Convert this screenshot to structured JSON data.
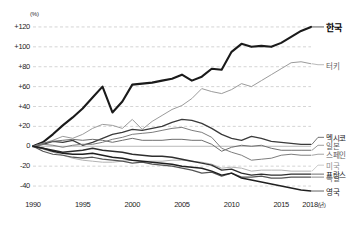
{
  "chart_data": {
    "type": "line",
    "title": "",
    "subtitle": "",
    "xlabel": "",
    "ylabel": "(%)",
    "unit_label": "(%)",
    "x_axis_suffix": "(년)",
    "xlim": [
      1990,
      2018
    ],
    "ylim": [
      -50,
      130
    ],
    "y_ticks": [
      "+120",
      "+100",
      "+80",
      "+60",
      "+40",
      "+20",
      "0",
      "-20",
      "-40"
    ],
    "y_tick_values": [
      120,
      100,
      80,
      60,
      40,
      20,
      0,
      -20,
      -40
    ],
    "x_ticks": [
      "1990",
      "1995",
      "2000",
      "2005",
      "2010",
      "2015",
      "2018"
    ],
    "x_tick_values": [
      1990,
      1995,
      2000,
      2005,
      2010,
      2015,
      2018
    ],
    "grid": true,
    "grid_style": "dashed-horizontal",
    "legend_position": "right-inline",
    "x": [
      1990,
      1991,
      1992,
      1993,
      1994,
      1995,
      1996,
      1997,
      1998,
      1999,
      2000,
      2001,
      2002,
      2003,
      2004,
      2005,
      2006,
      2007,
      2008,
      2009,
      2010,
      2011,
      2012,
      2013,
      2014,
      2015,
      2016,
      2017,
      2018
    ],
    "series": [
      {
        "name": "한국",
        "label": "한국",
        "color": "#1a1a1a",
        "width": 2.1,
        "emphasis": true,
        "label_y": 120,
        "values": [
          0,
          4,
          12,
          21,
          29,
          38,
          49,
          60,
          34,
          45,
          62,
          63,
          64,
          66,
          68,
          72,
          66,
          70,
          78,
          77,
          95,
          103,
          100,
          101,
          100,
          104,
          110,
          116,
          120
        ]
      },
      {
        "name": "터키",
        "label": "터키",
        "color": "#9b9b9b",
        "width": 1.0,
        "emphasis": false,
        "label_y": 82,
        "values": [
          0,
          3,
          6,
          10,
          8,
          12,
          18,
          22,
          21,
          18,
          27,
          17,
          25,
          31,
          37,
          41,
          48,
          58,
          55,
          53,
          57,
          63,
          60,
          66,
          72,
          78,
          84,
          85,
          83
        ]
      },
      {
        "name": "멕시코",
        "label": "멕시코",
        "color": "#3a3a3a",
        "width": 1.3,
        "emphasis": false,
        "label_y": 9,
        "values": [
          0,
          2,
          5,
          4,
          6,
          1,
          4,
          8,
          12,
          14,
          17,
          16,
          18,
          20,
          24,
          27,
          26,
          23,
          18,
          12,
          8,
          6,
          10,
          8,
          5,
          4,
          3,
          2,
          2
        ]
      },
      {
        "name": "일본",
        "label": "일본",
        "color": "#6e6e6e",
        "width": 1.0,
        "emphasis": false,
        "label_y": 1,
        "values": [
          0,
          3,
          5,
          6,
          7,
          6,
          7,
          6,
          4,
          6,
          8,
          6,
          6,
          6,
          7,
          7,
          6,
          6,
          2,
          -5,
          -1,
          1,
          0,
          1,
          -2,
          -4,
          -4,
          -4,
          -4
        ]
      },
      {
        "name": "스페인",
        "label": "스페인",
        "color": "#7d7d7d",
        "width": 1.0,
        "emphasis": false,
        "label_y": -8,
        "values": [
          0,
          2,
          1,
          -1,
          1,
          2,
          2,
          4,
          7,
          9,
          12,
          13,
          14,
          16,
          18,
          19,
          16,
          14,
          9,
          -2,
          -6,
          -9,
          -14,
          -13,
          -12,
          -9,
          -8,
          -9,
          -9
        ]
      },
      {
        "name": "미국",
        "label": "미국",
        "color": "#b3b3b3",
        "width": 1.0,
        "emphasis": false,
        "label_y": -19,
        "values": [
          0,
          -3,
          -6,
          -9,
          -12,
          -14,
          -15,
          -16,
          -16,
          -15,
          -14,
          -15,
          -15,
          -15,
          -14,
          -14,
          -15,
          -16,
          -18,
          -22,
          -21,
          -22,
          -25,
          -24,
          -24,
          -24,
          -25,
          -25,
          -25
        ]
      },
      {
        "name": "프랑스",
        "label": "프랑스",
        "color": "#2e2e2e",
        "width": 1.4,
        "emphasis": false,
        "label_y": -28,
        "values": [
          0,
          -2,
          -4,
          -6,
          -5,
          -4,
          -2,
          -4,
          -5,
          -6,
          -8,
          -9,
          -10,
          -10,
          -11,
          -13,
          -15,
          -17,
          -19,
          -24,
          -23,
          -27,
          -29,
          -28,
          -29,
          -29,
          -28,
          -28,
          -28
        ]
      },
      {
        "name": "독일",
        "label": "독일",
        "color": "#545454",
        "width": 1.2,
        "emphasis": false,
        "label_y": -31,
        "values": [
          0,
          -5,
          -8,
          -9,
          -11,
          -12,
          -11,
          -13,
          -14,
          -15,
          -17,
          -16,
          -18,
          -19,
          -20,
          -22,
          -24,
          -27,
          -26,
          -30,
          -27,
          -31,
          -31,
          -30,
          -32,
          -32,
          -31,
          -31,
          -31
        ]
      },
      {
        "name": "영국",
        "label": "영국",
        "color": "#1f1f1f",
        "width": 1.5,
        "emphasis": false,
        "label_y": -45,
        "values": [
          0,
          -2,
          -5,
          -7,
          -8,
          -8,
          -7,
          -9,
          -11,
          -12,
          -14,
          -15,
          -16,
          -17,
          -18,
          -20,
          -21,
          -22,
          -25,
          -29,
          -27,
          -32,
          -34,
          -36,
          -38,
          -40,
          -42,
          -44,
          -45
        ]
      }
    ]
  }
}
